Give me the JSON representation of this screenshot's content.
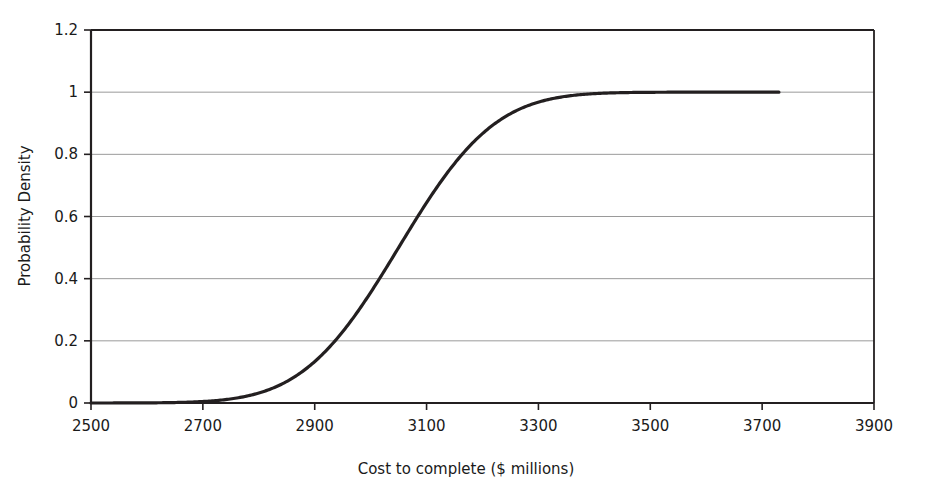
{
  "chart_data": {
    "type": "line",
    "title": "",
    "subtitle": "",
    "xlabel": "Cost to complete ($ millions)",
    "ylabel": "Probability Density",
    "xlim": [
      2500,
      3900
    ],
    "ylim": [
      0,
      1.2
    ],
    "x_ticks": [
      2500,
      2700,
      2900,
      3100,
      3300,
      3500,
      3700,
      3900
    ],
    "x_tick_labels": [
      "2500",
      "2700",
      "2900",
      "3100",
      "3300",
      "3500",
      "3700",
      "3900"
    ],
    "y_ticks": [
      0,
      0.2,
      0.4,
      0.6,
      0.8,
      1,
      1.2
    ],
    "y_tick_labels": [
      "0",
      "0.2",
      "0.4",
      "0.6",
      "0.8",
      "1",
      "1.2"
    ],
    "grid": "horizontal",
    "legend": "none",
    "line_color": "#231f20",
    "line_width": 3.2,
    "grid_color": "#9a9a9a",
    "axis_color": "#231f20",
    "background_color": "#ffffff",
    "distribution": {
      "family": "normal-cdf",
      "mean": 3050,
      "std_dev": 135
    },
    "series": [
      {
        "name": "Cumulative probability",
        "x_start": 2500,
        "x_end": 3730,
        "x": [
          2500,
          2550,
          2600,
          2650,
          2700,
          2750,
          2800,
          2850,
          2900,
          2950,
          3000,
          3050,
          3100,
          3150,
          3200,
          3250,
          3300,
          3350,
          3400,
          3450,
          3500,
          3550,
          3600,
          3650,
          3700,
          3730
        ],
        "values": [
          0.0,
          0.0,
          0.0,
          0.001,
          0.005,
          0.014,
          0.034,
          0.069,
          0.133,
          0.229,
          0.354,
          0.5,
          0.646,
          0.771,
          0.867,
          0.931,
          0.966,
          0.986,
          0.995,
          0.999,
          0.999,
          1.0,
          1.0,
          1.0,
          1.0,
          1.0
        ]
      }
    ],
    "annotations": []
  }
}
